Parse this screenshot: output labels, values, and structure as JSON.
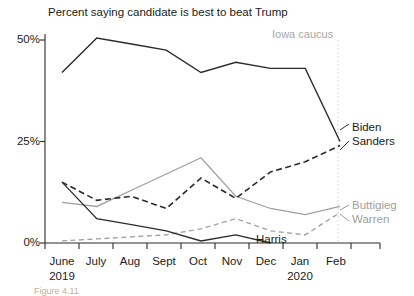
{
  "chart_data": {
    "type": "line",
    "title": "Percent saying candidate is best to beat Trump",
    "xlabel": "",
    "ylabel": "",
    "ylim": [
      0,
      52
    ],
    "yticks": [
      0,
      25,
      50
    ],
    "ytick_labels": [
      "0%",
      "25%",
      "50%"
    ],
    "grid": false,
    "legend_position": "right-inline",
    "categories": [
      "June 2019",
      "July",
      "Aug",
      "Sept",
      "Oct",
      "Nov",
      "Dec",
      "Jan 2020",
      "Feb"
    ],
    "x_tick_labels": [
      {
        "label": "June",
        "sub": "2019"
      },
      {
        "label": "July",
        "sub": ""
      },
      {
        "label": "Aug",
        "sub": ""
      },
      {
        "label": "Sept",
        "sub": ""
      },
      {
        "label": "Oct",
        "sub": ""
      },
      {
        "label": "Nov",
        "sub": ""
      },
      {
        "label": "Dec",
        "sub": ""
      },
      {
        "label": "Jan",
        "sub": "2020"
      },
      {
        "label": "Feb",
        "sub": ""
      }
    ],
    "series": [
      {
        "name": "Biden",
        "color": "#2b2b2b",
        "style": "solid",
        "values": [
          42,
          50.5,
          49,
          47.5,
          42,
          44.5,
          43,
          43,
          25
        ]
      },
      {
        "name": "Sanders",
        "color": "#2b2b2b",
        "style": "dashed",
        "values": [
          15,
          10.5,
          11.5,
          8.5,
          16,
          11,
          17.5,
          20,
          24
        ]
      },
      {
        "name": "Buttigieg",
        "color": "#a0a0a0",
        "style": "solid",
        "values": [
          10,
          9,
          13,
          17,
          21,
          11.5,
          8.5,
          7,
          9
        ]
      },
      {
        "name": "Warren",
        "color": "#a0a0a0",
        "style": "dashed",
        "values": [
          0.5,
          1,
          1.5,
          2,
          3.5,
          6,
          3,
          2,
          7.5
        ]
      },
      {
        "name": "Harris",
        "color": "#2b2b2b",
        "style": "solid",
        "values": [
          15,
          6,
          4.5,
          3,
          0.5,
          2,
          0,
          null,
          null
        ]
      }
    ],
    "annotations": [
      {
        "name": "iowa-caucus",
        "text": "Iowa caucus",
        "x": "Jan 2020",
        "color": "#a8a8a8"
      }
    ]
  },
  "labels": {
    "series": {
      "biden": "Biden",
      "sanders": "Sanders",
      "buttigieg": "Buttigieg",
      "warren": "Warren",
      "harris": "Harris"
    },
    "annotation_iowa": "Iowa caucus",
    "ytick_50": "50%",
    "ytick_25": "25%",
    "ytick_0": "0%",
    "x_june": "June",
    "x_june_year": "2019",
    "x_july": "July",
    "x_aug": "Aug",
    "x_sept": "Sept",
    "x_oct": "Oct",
    "x_nov": "Nov",
    "x_dec": "Dec",
    "x_jan": "Jan",
    "x_jan_year": "2020",
    "x_feb": "Feb",
    "title": "Percent saying candidate is best to beat Trump",
    "figure_caption": "Figure 4.11"
  }
}
